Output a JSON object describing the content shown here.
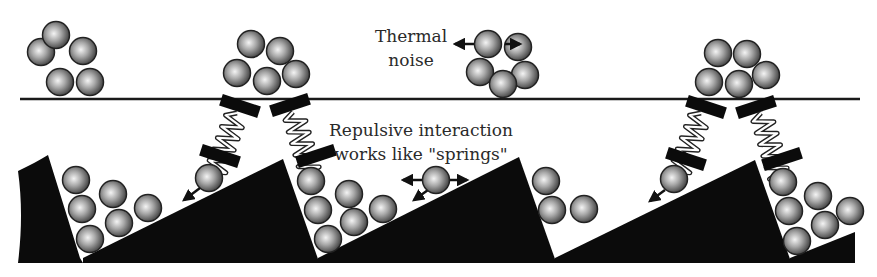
{
  "diagram": {
    "labels": {
      "thermal_noise_line1": "Thermal",
      "thermal_noise_line2": "noise",
      "repulsive_line1": "Repulsive interaction",
      "repulsive_line2": "works like \"springs\""
    },
    "colors": {
      "background": "#ffffff",
      "surface": "#0b0b0b",
      "line": "#1a1a1a",
      "ball_light": "#f2f2f2",
      "ball_mid": "#9a9a9a",
      "ball_dark": "#3a3a3a",
      "text": "#2a2a2a"
    },
    "elements": {
      "reference_line": "horizontal line separating upper clusters from ratchet",
      "clusters_above_line": 4,
      "spring_pairs": 2,
      "sawtooth_teeth": 4
    }
  }
}
